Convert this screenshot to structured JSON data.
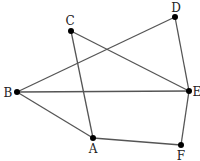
{
  "diagram": {
    "type": "graph",
    "colors": {
      "edge": "#555555",
      "node": "#000000",
      "label": "#222222",
      "background": "#ffffff"
    },
    "nodes": [
      {
        "id": "A",
        "label": "A",
        "x": 93,
        "y": 138,
        "lx": 93,
        "ly": 153,
        "anchor": "middle"
      },
      {
        "id": "B",
        "label": "B",
        "x": 17,
        "y": 92,
        "lx": 8,
        "ly": 97,
        "anchor": "middle"
      },
      {
        "id": "C",
        "label": "C",
        "x": 71,
        "y": 31,
        "lx": 70,
        "ly": 25,
        "anchor": "middle"
      },
      {
        "id": "D",
        "label": "D",
        "x": 175,
        "y": 17,
        "lx": 176,
        "ly": 12,
        "anchor": "middle"
      },
      {
        "id": "E",
        "label": "E",
        "x": 189,
        "y": 91,
        "lx": 197,
        "ly": 96,
        "anchor": "middle"
      },
      {
        "id": "F",
        "label": "F",
        "x": 181,
        "y": 145,
        "lx": 181,
        "ly": 160,
        "anchor": "middle"
      }
    ],
    "edges": [
      {
        "from": "C",
        "to": "A"
      },
      {
        "from": "C",
        "to": "E"
      },
      {
        "from": "D",
        "to": "B"
      },
      {
        "from": "D",
        "to": "E"
      },
      {
        "from": "B",
        "to": "E"
      },
      {
        "from": "B",
        "to": "A"
      },
      {
        "from": "A",
        "to": "F"
      },
      {
        "from": "E",
        "to": "F"
      }
    ]
  }
}
